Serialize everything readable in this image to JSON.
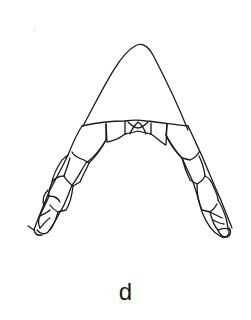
{
  "figure": {
    "panel_label": "d",
    "stroke_color": "#1a1a1a",
    "background": "#ffffff"
  }
}
